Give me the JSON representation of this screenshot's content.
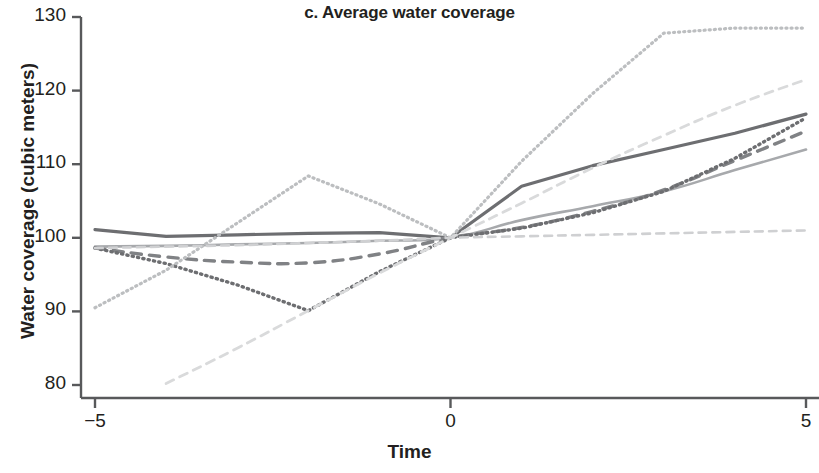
{
  "chart_data": {
    "type": "line",
    "title": "c. Average water coverage",
    "xlabel": "Time",
    "ylabel": "Water coverage (cubic meters)",
    "xlim": [
      -5,
      5
    ],
    "ylim": [
      80,
      130
    ],
    "xticks": [
      -5,
      0,
      5
    ],
    "xtick_labels": [
      "−5",
      "0",
      "5"
    ],
    "yticks": [
      80,
      90,
      100,
      110,
      120,
      130
    ],
    "ytick_labels": [
      "80",
      "90",
      "100",
      "110",
      "120",
      "130"
    ],
    "grid": false,
    "legend": "none",
    "axis_color": "#58595b",
    "text_color": "#231f20",
    "series": [
      {
        "name": "solid-dark-gray",
        "style": "solid",
        "color": "#6d6e71",
        "width": 3.2,
        "x": [
          -5,
          -4,
          -3,
          -2,
          -1,
          0,
          1,
          2,
          3,
          4,
          5
        ],
        "values": [
          101.1,
          100.2,
          100.4,
          100.6,
          100.7,
          100.0,
          107.0,
          109.8,
          112.0,
          114.2,
          116.8
        ]
      },
      {
        "name": "solid-light-gray",
        "style": "solid",
        "color": "#a7a9ac",
        "width": 2.6,
        "x": [
          -5,
          -4,
          -3,
          -2,
          -1,
          0,
          1,
          2,
          3,
          4,
          5
        ],
        "values": [
          98.8,
          98.9,
          99.1,
          99.3,
          99.6,
          100.0,
          102.4,
          104.3,
          106.3,
          109.2,
          112.0
        ]
      },
      {
        "name": "dashed-dark-gray",
        "style": "dashed",
        "color": "#808285",
        "width": 3.4,
        "x": [
          -5,
          -4,
          -3,
          -2,
          -1,
          0,
          1,
          2,
          3,
          4,
          5
        ],
        "values": [
          98.6,
          97.4,
          96.7,
          96.6,
          97.8,
          100.0,
          101.4,
          103.6,
          106.5,
          110.5,
          114.5
        ]
      },
      {
        "name": "dotted-dark-gray",
        "style": "dotted",
        "color": "#6d6e71",
        "width": 3.4,
        "x": [
          -5,
          -4,
          -3,
          -2,
          -1,
          0,
          1,
          2,
          3,
          4,
          5
        ],
        "values": [
          98.6,
          96.5,
          93.6,
          90.1,
          95.4,
          100.0,
          101.3,
          103.4,
          106.3,
          110.8,
          116.3
        ]
      },
      {
        "name": "dotted-light-gray-peaked",
        "style": "dotted",
        "color": "#bcbec0",
        "width": 3.2,
        "x": [
          -5,
          -4,
          -3,
          -2,
          -1,
          0,
          1,
          2,
          3,
          4,
          5
        ],
        "values": [
          90.5,
          95.6,
          102.0,
          108.4,
          104.6,
          100.0,
          110.4,
          119.6,
          127.8,
          128.5,
          128.5
        ]
      },
      {
        "name": "dashed-very-light-rising",
        "style": "dashed",
        "color": "#d9dadb",
        "width": 2.8,
        "x": [
          -4,
          -3,
          -2,
          -1,
          0,
          1,
          2,
          3,
          4,
          5
        ],
        "values": [
          80.2,
          85.0,
          90.1,
          95.2,
          100.0,
          104.7,
          109.5,
          113.9,
          118.0,
          121.5
        ]
      },
      {
        "name": "dashed-light-flat",
        "style": "dashed",
        "color": "#cfd0d2",
        "width": 2.6,
        "x": [
          -5,
          -4,
          -3,
          -2,
          -1,
          0,
          1,
          2,
          3,
          4,
          5
        ],
        "values": [
          98.6,
          98.8,
          99.0,
          99.3,
          99.6,
          100.0,
          100.2,
          100.4,
          100.6,
          100.8,
          101.0
        ]
      }
    ]
  },
  "axes_geometry": {
    "plot_left": 95,
    "plot_right": 806,
    "plot_top": 17,
    "plot_bottom": 385,
    "axis_x": 81,
    "axis_y": 398
  }
}
